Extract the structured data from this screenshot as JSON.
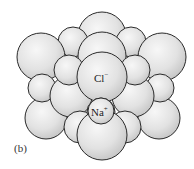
{
  "figure": {
    "panel_label": "(b)",
    "ions": {
      "chloride": {
        "symbol": "Cl",
        "charge": "−"
      },
      "sodium": {
        "symbol": "Na",
        "charge": "+"
      }
    },
    "colors": {
      "sphere_fill_light": "#f4f4f4",
      "sphere_fill_dark": "#c8c8c8",
      "sphere_stroke": "#2a2a2a",
      "background": "#ffffff"
    }
  }
}
